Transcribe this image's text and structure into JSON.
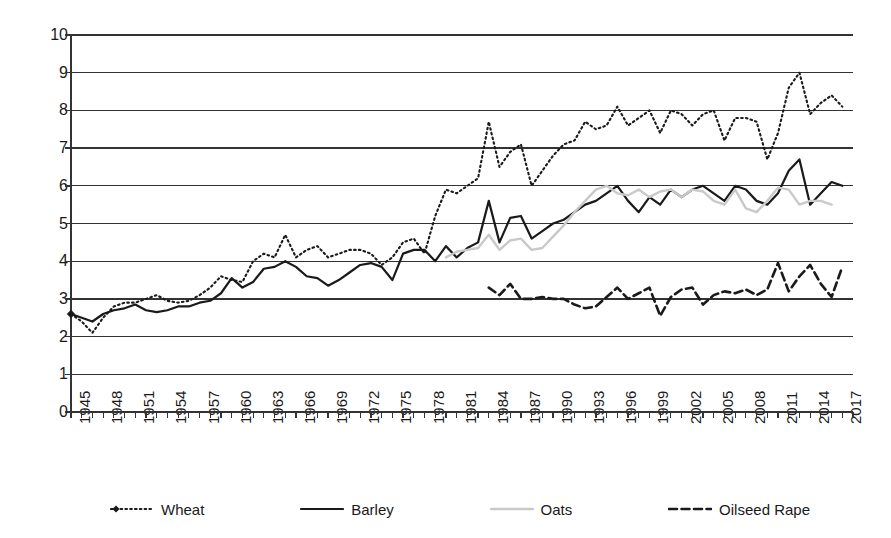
{
  "chart_data": {
    "type": "line",
    "title": "",
    "xlabel": "",
    "ylabel": "Yield (t/ha)",
    "ylim": [
      0,
      10
    ],
    "xlim": [
      1945,
      2018
    ],
    "grid": "horizontal",
    "legend_position": "bottom",
    "ytick_labels": [
      "10",
      "9",
      "8",
      "7",
      "6",
      "5",
      "4",
      "3",
      "2",
      "1",
      "0"
    ],
    "ytick_values": [
      10,
      9,
      8,
      7,
      6,
      5,
      4,
      3,
      2,
      1,
      0
    ],
    "xtick_labels": [
      "1945",
      "1948",
      "1951",
      "1954",
      "1957",
      "1960",
      "1963",
      "1966",
      "1969",
      "1972",
      "1975",
      "1978",
      "1981",
      "1984",
      "1987",
      "1990",
      "1993",
      "1996",
      "1999",
      "2002",
      "2005",
      "2008",
      "2011",
      "2014",
      "2017"
    ],
    "xtick_values": [
      1945,
      1948,
      1951,
      1954,
      1957,
      1960,
      1963,
      1966,
      1969,
      1972,
      1975,
      1978,
      1981,
      1984,
      1987,
      1990,
      1993,
      1996,
      1999,
      2002,
      2005,
      2008,
      2011,
      2014,
      2017
    ],
    "minor_tick_interval": 1,
    "series": [
      {
        "name": "Wheat",
        "style": "dotted",
        "color": "#1a1a1a",
        "marker": "diamond-first-point",
        "x_start": 1945,
        "values": [
          2.6,
          2.4,
          2.1,
          2.5,
          2.8,
          2.9,
          2.9,
          3.0,
          3.1,
          2.95,
          2.9,
          2.95,
          3.1,
          3.3,
          3.6,
          3.5,
          3.45,
          4.0,
          4.2,
          4.1,
          4.7,
          4.1,
          4.3,
          4.4,
          4.1,
          4.2,
          4.3,
          4.3,
          4.2,
          3.9,
          4.1,
          4.5,
          4.6,
          4.2,
          5.2,
          5.9,
          5.8,
          6.0,
          6.2,
          7.7,
          6.5,
          6.9,
          7.1,
          6.0,
          6.4,
          6.8,
          7.1,
          7.2,
          7.7,
          7.5,
          7.6,
          8.1,
          7.6,
          7.8,
          8.0,
          7.4,
          8.0,
          7.9,
          7.6,
          7.9,
          8.0,
          7.2,
          7.8,
          7.8,
          7.7,
          6.7,
          7.4,
          8.6,
          9.0,
          7.9,
          8.2,
          8.4,
          8.1
        ]
      },
      {
        "name": "Barley",
        "style": "solid",
        "color": "#1a1a1a",
        "x_start": 1945,
        "values": [
          2.6,
          2.5,
          2.4,
          2.6,
          2.7,
          2.75,
          2.85,
          2.7,
          2.65,
          2.7,
          2.8,
          2.8,
          2.9,
          2.95,
          3.15,
          3.55,
          3.3,
          3.45,
          3.8,
          3.85,
          4.0,
          3.85,
          3.6,
          3.55,
          3.35,
          3.5,
          3.7,
          3.9,
          3.95,
          3.85,
          3.5,
          4.2,
          4.3,
          4.3,
          4.0,
          4.4,
          4.1,
          4.35,
          4.5,
          5.6,
          4.5,
          5.15,
          5.2,
          4.6,
          4.8,
          5.0,
          5.1,
          5.3,
          5.5,
          5.6,
          5.8,
          6.0,
          5.6,
          5.3,
          5.7,
          5.5,
          5.9,
          5.7,
          5.9,
          6.0,
          5.8,
          5.6,
          6.0,
          5.9,
          5.6,
          5.5,
          5.8,
          6.4,
          6.7,
          5.5,
          5.8,
          6.1,
          6.0
        ]
      },
      {
        "name": "Oats",
        "style": "solid-light",
        "color": "#c9c9c9",
        "x_start": 1980,
        "values": [
          4.1,
          4.25,
          4.3,
          4.35,
          4.7,
          4.3,
          4.55,
          4.6,
          4.3,
          4.35,
          4.65,
          4.95,
          5.3,
          5.6,
          5.9,
          6.0,
          5.8,
          5.75,
          5.9,
          5.7,
          5.85,
          5.9,
          5.7,
          5.9,
          5.85,
          5.6,
          5.5,
          5.9,
          5.4,
          5.3,
          5.6,
          5.95,
          5.9,
          5.5,
          5.6,
          5.6,
          5.5
        ]
      },
      {
        "name": "Oilseed Rape",
        "style": "dashed",
        "color": "#1a1a1a",
        "x_start": 1984,
        "values": [
          3.3,
          3.1,
          3.4,
          3.0,
          3.0,
          3.05,
          3.0,
          3.0,
          2.85,
          2.75,
          2.8,
          3.05,
          3.3,
          3.0,
          3.15,
          3.3,
          2.55,
          3.05,
          3.25,
          3.3,
          2.85,
          3.1,
          3.2,
          3.15,
          3.25,
          3.1,
          3.25,
          3.95,
          3.2,
          3.6,
          3.9,
          3.4,
          3.05,
          3.85
        ]
      }
    ]
  },
  "legend": {
    "items": [
      {
        "label": "Wheat",
        "icon": "dotted-line-with-diamond-marker"
      },
      {
        "label": "Barley",
        "icon": "solid-line"
      },
      {
        "label": "Oats",
        "icon": "light-gray-line"
      },
      {
        "label": "Oilseed Rape",
        "icon": "dashed-line"
      }
    ]
  }
}
